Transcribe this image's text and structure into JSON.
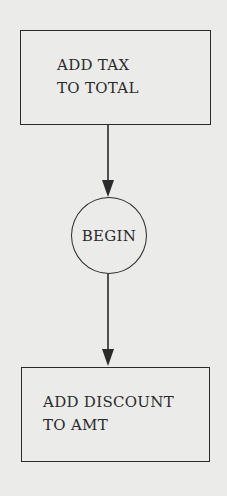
{
  "diagram": {
    "type": "flowchart",
    "nodes": [
      {
        "id": "n1",
        "shape": "rectangle",
        "lines": [
          "ADD TAX",
          "TO TOTAL"
        ]
      },
      {
        "id": "n2",
        "shape": "circle",
        "label": "BEGIN"
      },
      {
        "id": "n3",
        "shape": "rectangle",
        "lines": [
          "ADD DISCOUNT",
          "TO AMT"
        ]
      }
    ],
    "edges": [
      {
        "from": "n1",
        "to": "n2",
        "arrow": "down"
      },
      {
        "from": "n2",
        "to": "n3",
        "arrow": "down"
      }
    ]
  },
  "colors": {
    "background": "#ebebea",
    "stroke": "#2a2a2a"
  }
}
